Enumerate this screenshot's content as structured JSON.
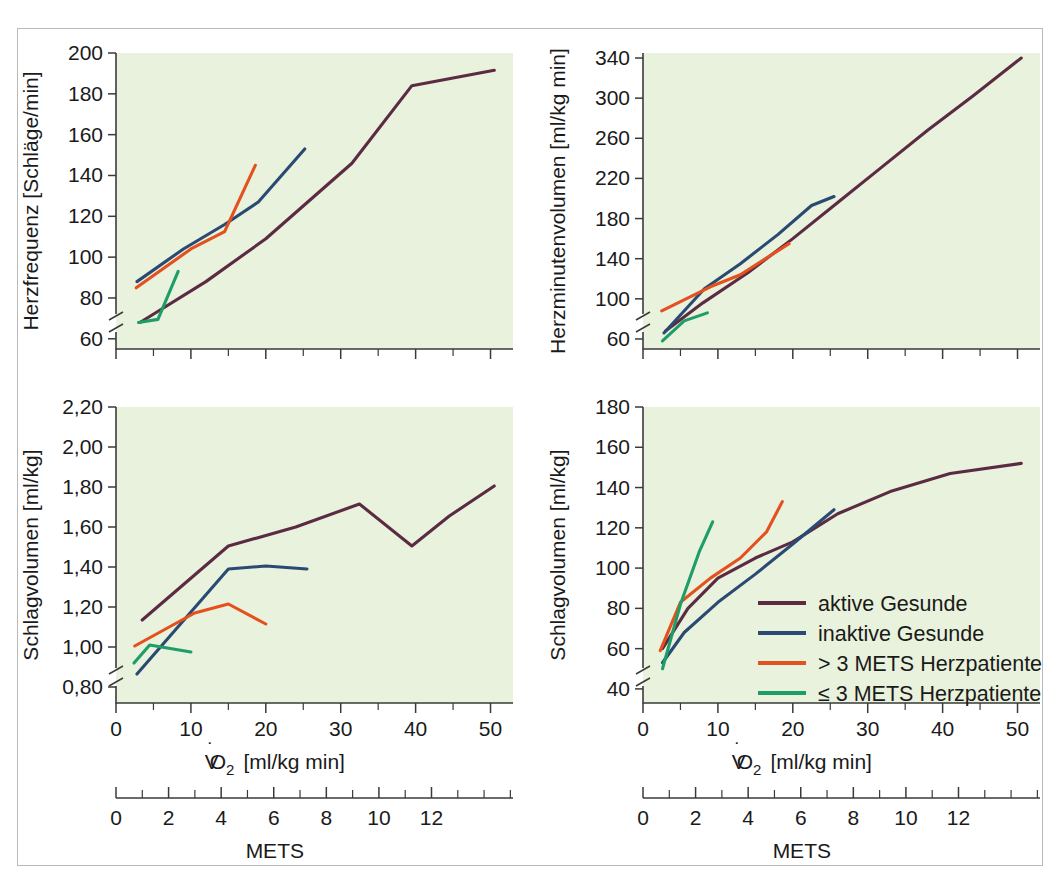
{
  "figure": {
    "background_color": "#ffffff",
    "plot_background_color": "#e9f2dc",
    "frame_color": "#b9b9b9"
  },
  "colors": {
    "aktive_gesunde": "#5b2b44",
    "inaktive_gesunde": "#2a4a73",
    "mets_gt3": "#e4501e",
    "mets_le3": "#1f9d68"
  },
  "legend": {
    "position": "bottom-right-panel",
    "items": [
      {
        "label": "aktive Gesunde",
        "color": "#5b2b44"
      },
      {
        "label": "inaktive Gesunde",
        "color": "#2a4a73"
      },
      {
        "label": "> 3 METS Herzpatienten",
        "color": "#e4501e"
      },
      {
        "label": "≤ 3 METS Herzpatienten",
        "color": "#1f9d68"
      }
    ]
  },
  "shared_x": {
    "primary": {
      "label_main": "V",
      "label_dot": "̇",
      "label_sub": "O",
      "label_sub2": "2",
      "label_units": "[ml/kg min]",
      "full_label": "V̇O2  [ml/kg min]",
      "ticks": [
        0,
        10,
        20,
        30,
        40,
        50
      ],
      "tick_labels": [
        "0",
        "10",
        "20",
        "30",
        "40",
        "50"
      ],
      "min": 0,
      "max": 53,
      "minor_step": 5
    },
    "secondary": {
      "label": "METS",
      "ticks": [
        0,
        2,
        4,
        6,
        8,
        10,
        12
      ],
      "tick_labels": [
        "0",
        "2",
        "4",
        "6",
        "8",
        "10",
        "12"
      ],
      "min": 0,
      "max": 15.1,
      "minor_step": 1
    }
  },
  "chart_data": [
    {
      "id": "panel-top-left",
      "type": "line",
      "title": "",
      "xlabel": "V̇O2  [ml/kg min]",
      "ylabel": "Herzfrequenz [Schläge/min]",
      "ylabel_name": "Herzfrequenz",
      "ylabel_units": "[Schläge/min]",
      "xlim": [
        0,
        53
      ],
      "ylim": [
        55,
        200
      ],
      "yticks": [
        60,
        80,
        100,
        120,
        140,
        160,
        180,
        200
      ],
      "ytick_labels": [
        "60",
        "80",
        "100",
        "120",
        "140",
        "160",
        "180",
        "200"
      ],
      "axis_break": true,
      "grid": false,
      "series": [
        {
          "name": "aktive Gesunde",
          "color": "#5b2b44",
          "x": [
            3.2,
            12.0,
            20.0,
            31.5,
            39.5,
            50.5
          ],
          "y": [
            68.0,
            88.0,
            109.0,
            146.0,
            184.0,
            191.5
          ]
        },
        {
          "name": "inaktive Gesunde",
          "color": "#2a4a73",
          "x": [
            2.8,
            9.0,
            14.5,
            19.0,
            25.2
          ],
          "y": [
            88.0,
            104.0,
            116.0,
            127.0,
            153.0
          ]
        },
        {
          "name": "> 3 METS Herzpatienten",
          "color": "#e4501e",
          "x": [
            2.7,
            10.0,
            14.5,
            18.6
          ],
          "y": [
            85.0,
            104.0,
            112.5,
            145.0
          ]
        },
        {
          "name": "≤ 3 METS Herzpatienten",
          "color": "#1f9d68",
          "x": [
            3.0,
            5.6,
            8.3
          ],
          "y": [
            68.0,
            69.5,
            93.0
          ]
        }
      ]
    },
    {
      "id": "panel-top-right",
      "type": "line",
      "title": "",
      "xlabel": "V̇O2  [ml/kg min]",
      "ylabel": "Herzminutenvolumen [ml/kg min]",
      "ylabel_name": "Herzminutenvolumen",
      "ylabel_units": "[ml/kg min]",
      "xlim": [
        0,
        53
      ],
      "ylim": [
        50,
        345
      ],
      "yticks": [
        60,
        100,
        140,
        180,
        220,
        260,
        300,
        340
      ],
      "ytick_labels": [
        "60",
        "100",
        "140",
        "180",
        "220",
        "260",
        "300",
        "340"
      ],
      "axis_break": true,
      "grid": false,
      "series": [
        {
          "name": "aktive Gesunde",
          "color": "#5b2b44",
          "x": [
            3.0,
            8.0,
            14.0,
            20.0,
            26.0,
            32.0,
            38.0,
            44.0,
            50.5
          ],
          "y": [
            68.0,
            96.0,
            126.0,
            160.0,
            196.0,
            232.0,
            268.0,
            302.0,
            340.0
          ]
        },
        {
          "name": "inaktive Gesunde",
          "color": "#2a4a73",
          "x": [
            2.8,
            8.2,
            13.0,
            18.0,
            22.5,
            25.5
          ],
          "y": [
            66.0,
            110.0,
            135.0,
            164.0,
            193.0,
            202.0
          ]
        },
        {
          "name": "> 3 METS Herzpatienten",
          "color": "#e4501e",
          "x": [
            2.5,
            9.0,
            13.0,
            19.5
          ],
          "y": [
            88.0,
            112.0,
            124.0,
            155.0
          ]
        },
        {
          "name": "≤ 3 METS Herzpatienten",
          "color": "#1f9d68",
          "x": [
            2.6,
            5.5,
            8.6
          ],
          "y": [
            58.0,
            78.0,
            86.0
          ]
        }
      ]
    },
    {
      "id": "panel-bottom-left",
      "type": "line",
      "title": "",
      "xlabel": "V̇O2  [ml/kg min]",
      "ylabel": "Schlagvolumen [ml/kg]",
      "ylabel_name": "Schlagvolumen",
      "ylabel_units": "[ml/kg]",
      "xlim": [
        0,
        53
      ],
      "ylim": [
        0.72,
        2.2
      ],
      "yticks": [
        0.8,
        1.0,
        1.2,
        1.4,
        1.6,
        1.8,
        2.0,
        2.2
      ],
      "ytick_labels": [
        "0,80",
        "1,00",
        "1,20",
        "1,40",
        "1,60",
        "1,80",
        "2,00",
        "2,20"
      ],
      "axis_break": true,
      "grid": false,
      "series": [
        {
          "name": "aktive Gesunde",
          "color": "#5b2b44",
          "x": [
            3.5,
            15.0,
            24.0,
            32.5,
            39.5,
            44.5,
            50.5
          ],
          "y": [
            1.135,
            1.505,
            1.6,
            1.715,
            1.505,
            1.655,
            1.805
          ]
        },
        {
          "name": "inaktive Gesunde",
          "color": "#2a4a73",
          "x": [
            2.8,
            15.0,
            20.0,
            25.5
          ],
          "y": [
            0.865,
            1.39,
            1.405,
            1.39
          ]
        },
        {
          "name": "> 3 METS Herzpatienten",
          "color": "#e4501e",
          "x": [
            2.5,
            10.5,
            15.0,
            20.0
          ],
          "y": [
            1.005,
            1.17,
            1.215,
            1.115
          ]
        },
        {
          "name": "≤ 3 METS Herzpatienten",
          "color": "#1f9d68",
          "x": [
            2.4,
            4.5,
            10.0
          ],
          "y": [
            0.92,
            1.01,
            0.975
          ]
        }
      ]
    },
    {
      "id": "panel-bottom-right",
      "type": "line",
      "title": "",
      "xlabel": "V̇O2  [ml/kg min]",
      "ylabel": "Schlagvolumen [ml/kg]",
      "ylabel_name": "Schlagvolumen",
      "ylabel_units": "[ml/kg]",
      "xlim": [
        0,
        53
      ],
      "ylim": [
        33,
        180
      ],
      "yticks": [
        40,
        60,
        80,
        100,
        120,
        140,
        160,
        180
      ],
      "ytick_labels": [
        "40",
        "60",
        "80",
        "100",
        "120",
        "140",
        "160",
        "180"
      ],
      "axis_break": true,
      "grid": false,
      "series": [
        {
          "name": "aktive Gesunde",
          "color": "#5b2b44",
          "x": [
            2.6,
            6.0,
            10.0,
            15.0,
            20.0,
            26.0,
            33.0,
            41.0,
            50.5
          ],
          "y": [
            60.0,
            80.0,
            95.0,
            105.0,
            113.0,
            127.0,
            138.0,
            147.0,
            152.0
          ]
        },
        {
          "name": "inaktive Gesunde",
          "color": "#2a4a73",
          "x": [
            2.6,
            5.5,
            10.0,
            15.0,
            20.0,
            25.5
          ],
          "y": [
            53.0,
            68.0,
            83.0,
            97.0,
            112.0,
            129.0
          ]
        },
        {
          "name": "> 3 METS Herzpatienten",
          "color": "#e4501e",
          "x": [
            2.3,
            5.0,
            9.0,
            13.0,
            16.5,
            18.6
          ],
          "y": [
            59.0,
            83.0,
            95.0,
            105.0,
            118.0,
            133.0
          ]
        },
        {
          "name": "≤ 3 METS Herzpatienten",
          "color": "#1f9d68",
          "x": [
            2.6,
            5.0,
            7.5,
            9.3
          ],
          "y": [
            50.0,
            82.0,
            108.0,
            123.0
          ]
        }
      ]
    }
  ]
}
